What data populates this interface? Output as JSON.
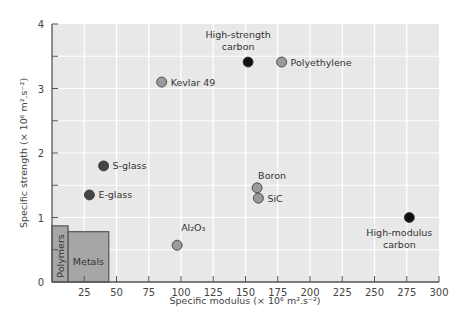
{
  "chart_data": {
    "type": "scatter",
    "title": "",
    "xlabel": "Specific modulus (× 10⁶ m².s⁻²)",
    "ylabel": "Specific strength (× 10⁶ m².s⁻²)",
    "xlim": [
      0,
      300
    ],
    "ylim": [
      0,
      4
    ],
    "xticks": [
      0,
      25,
      50,
      75,
      100,
      125,
      150,
      175,
      200,
      225,
      250,
      275,
      300
    ],
    "xtick_labels": [
      "25",
      "50",
      "75",
      "100",
      "125",
      "150",
      "175",
      "200",
      "225",
      "250",
      "275",
      "300"
    ],
    "yticks": [
      0,
      1,
      2,
      3,
      4
    ],
    "ytick_labels": [
      "0",
      "1",
      "2",
      "3",
      "4"
    ],
    "grid": true,
    "legend": null,
    "points": [
      {
        "label": "High-strength carbon",
        "label_lines": [
          "High-strength",
          "carbon"
        ],
        "x": 152,
        "y": 3.41,
        "fill": "#111111",
        "label_pos": "above"
      },
      {
        "label": "Polyethylene",
        "label_lines": [
          "Polyethylene"
        ],
        "x": 178,
        "y": 3.41,
        "fill": "#9a9a9a",
        "label_pos": "right"
      },
      {
        "label": "Kevlar 49",
        "label_lines": [
          "Kevlar 49"
        ],
        "x": 85,
        "y": 3.1,
        "fill": "#9a9a9a",
        "label_pos": "right"
      },
      {
        "label": "S-glass",
        "label_lines": [
          "S-glass"
        ],
        "x": 40,
        "y": 1.8,
        "fill": "#444444",
        "label_pos": "right"
      },
      {
        "label": "E-glass",
        "label_lines": [
          "E-glass"
        ],
        "x": 29,
        "y": 1.35,
        "fill": "#444444",
        "label_pos": "right"
      },
      {
        "label": "Boron",
        "label_lines": [
          "Boron"
        ],
        "x": 159,
        "y": 1.46,
        "fill": "#9a9a9a",
        "label_pos": "above-right"
      },
      {
        "label": "SiC",
        "label_lines": [
          "SiC"
        ],
        "x": 160,
        "y": 1.3,
        "fill": "#9a9a9a",
        "label_pos": "right"
      },
      {
        "label": "Al2O3",
        "label_lines": [
          "Al₂O₃"
        ],
        "x": 97,
        "y": 0.57,
        "fill": "#9a9a9a",
        "label_pos": "above-right"
      },
      {
        "label": "High-modulus carbon",
        "label_lines": [
          "High-modulus",
          "carbon"
        ],
        "x": 277,
        "y": 1.0,
        "fill": "#111111",
        "label_pos": "below"
      }
    ],
    "regions": [
      {
        "label": "Polymers",
        "x0": 0,
        "x1": 12.5,
        "y0": 0,
        "y1": 0.87,
        "fill": "#a6a6a6",
        "label_rotated": true
      },
      {
        "label": "Metals",
        "x0": 12.5,
        "x1": 44,
        "y0": 0,
        "y1": 0.78,
        "fill": "#a6a6a6",
        "label_rotated": false
      }
    ],
    "colors": {
      "plot_bg": "#e8e8e8",
      "grid": "#ffffff",
      "axis": "#555555"
    }
  }
}
